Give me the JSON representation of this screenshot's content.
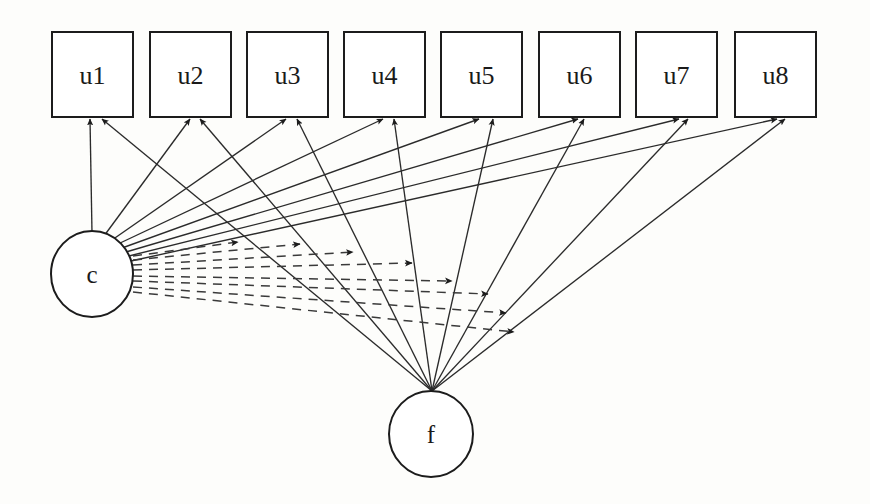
{
  "diagram": {
    "background_color": "#fdfdfb",
    "stroke_color": "#1c1c1c",
    "edge_color": "#2b2b2b",
    "dashed_edge_color": "#3a3a3a",
    "indicator_boxes": [
      {
        "id": "u1",
        "label": "u1",
        "x": 52,
        "y": 32,
        "w": 81,
        "h": 85
      },
      {
        "id": "u2",
        "label": "u2",
        "x": 150,
        "y": 32,
        "w": 81,
        "h": 85
      },
      {
        "id": "u3",
        "label": "u3",
        "x": 247,
        "y": 32,
        "w": 81,
        "h": 85
      },
      {
        "id": "u4",
        "label": "u4",
        "x": 344,
        "y": 32,
        "w": 81,
        "h": 85
      },
      {
        "id": "u5",
        "label": "u5",
        "x": 441,
        "y": 32,
        "w": 81,
        "h": 85
      },
      {
        "id": "u6",
        "label": "u6",
        "x": 539,
        "y": 32,
        "w": 81,
        "h": 85
      },
      {
        "id": "u7",
        "label": "u7",
        "x": 636,
        "y": 32,
        "w": 81,
        "h": 85
      },
      {
        "id": "u8",
        "label": "u8",
        "x": 735,
        "y": 32,
        "w": 81,
        "h": 85
      }
    ],
    "latent_circles": [
      {
        "id": "c",
        "label": "c",
        "cx": 92,
        "cy": 274,
        "rx": 41,
        "ry": 43
      },
      {
        "id": "f",
        "label": "f",
        "cx": 431,
        "cy": 434,
        "rx": 42,
        "ry": 43
      }
    ],
    "edges_from_c": [
      {
        "from": "c",
        "to": "u1",
        "style": "solid",
        "x1": 92,
        "y1": 233,
        "x2": 90,
        "y2": 119
      },
      {
        "from": "c",
        "to": "u2",
        "style": "solid",
        "x1": 104,
        "y1": 236,
        "x2": 190,
        "y2": 119
      },
      {
        "from": "c",
        "to": "u3",
        "style": "solid",
        "x1": 112,
        "y1": 240,
        "x2": 286,
        "y2": 119
      },
      {
        "from": "c",
        "to": "u4",
        "style": "solid",
        "x1": 118,
        "y1": 244,
        "x2": 383,
        "y2": 119
      },
      {
        "from": "c",
        "to": "u5",
        "style": "solid",
        "x1": 122,
        "y1": 248,
        "x2": 479,
        "y2": 119
      },
      {
        "from": "c",
        "to": "u6",
        "style": "solid",
        "x1": 126,
        "y1": 252,
        "x2": 578,
        "y2": 119
      },
      {
        "from": "c",
        "to": "u7",
        "style": "solid",
        "x1": 129,
        "y1": 256,
        "x2": 679,
        "y2": 119
      },
      {
        "from": "c",
        "to": "u8",
        "style": "solid",
        "x1": 131,
        "y1": 261,
        "x2": 777,
        "y2": 119
      }
    ],
    "edges_from_f": [
      {
        "from": "f",
        "to": "u1",
        "style": "solid",
        "x1": 432,
        "y1": 391,
        "x2": 102,
        "y2": 119
      },
      {
        "from": "f",
        "to": "u2",
        "style": "solid",
        "x1": 432,
        "y1": 391,
        "x2": 200,
        "y2": 119
      },
      {
        "from": "f",
        "to": "u3",
        "style": "solid",
        "x1": 432,
        "y1": 391,
        "x2": 297,
        "y2": 119
      },
      {
        "from": "f",
        "to": "u4",
        "style": "solid",
        "x1": 432,
        "y1": 391,
        "x2": 394,
        "y2": 119
      },
      {
        "from": "f",
        "to": "u5",
        "style": "solid",
        "x1": 432,
        "y1": 391,
        "x2": 493,
        "y2": 119
      },
      {
        "from": "f",
        "to": "u6",
        "style": "solid",
        "x1": 432,
        "y1": 391,
        "x2": 584,
        "y2": 119
      },
      {
        "from": "f",
        "to": "u7",
        "style": "solid",
        "x1": 432,
        "y1": 391,
        "x2": 688,
        "y2": 119
      },
      {
        "from": "f",
        "to": "u8",
        "style": "solid",
        "x1": 432,
        "y1": 391,
        "x2": 785,
        "y2": 119
      }
    ],
    "edges_c_to_f_paths": [
      {
        "from": "c",
        "style": "dashed",
        "x1": 133,
        "y1": 256,
        "x2": 238,
        "y2": 242
      },
      {
        "from": "c",
        "style": "dashed",
        "x1": 133,
        "y1": 260,
        "x2": 300,
        "y2": 244
      },
      {
        "from": "c",
        "style": "dashed",
        "x1": 133,
        "y1": 265,
        "x2": 353,
        "y2": 252
      },
      {
        "from": "c",
        "style": "dashed",
        "x1": 133,
        "y1": 270,
        "x2": 412,
        "y2": 263
      },
      {
        "from": "c",
        "style": "dashed",
        "x1": 133,
        "y1": 276,
        "x2": 452,
        "y2": 281
      },
      {
        "from": "c",
        "style": "dashed",
        "x1": 133,
        "y1": 281,
        "x2": 488,
        "y2": 294
      },
      {
        "from": "c",
        "style": "dashed",
        "x1": 133,
        "y1": 287,
        "x2": 506,
        "y2": 313
      },
      {
        "from": "c",
        "style": "dashed",
        "x1": 133,
        "y1": 292,
        "x2": 514,
        "y2": 332
      }
    ]
  }
}
